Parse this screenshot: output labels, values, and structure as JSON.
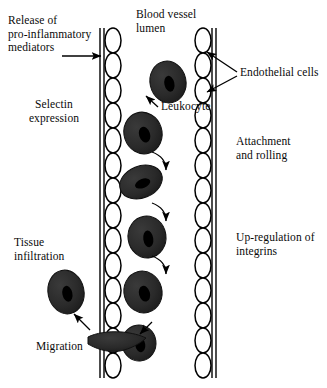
{
  "figure": {
    "background": "#ffffff",
    "ink": "#000000",
    "cell_fill": "#262626"
  },
  "labels": {
    "release": "Release of\npro-inflammatory\nmediators",
    "selectin": "Selectin\nexpression",
    "lumen": "Blood vessel\nlumen",
    "leukocyte": "Leukocyte",
    "endothelial": "Endothelial cells",
    "attachment": "Attachment\nand rolling",
    "upregulation": "Up-regulation of\nintegrins",
    "tissue": "Tissue\ninfiltration",
    "migration": "Migration"
  },
  "vessel": {
    "left_wall": {
      "line_x1": 100,
      "line_x2": 104,
      "ovals_x": 113,
      "oval_rx": 8,
      "oval_ry": 12.5
    },
    "right_wall": {
      "line_x1": 212,
      "line_x2": 216,
      "ovals_x": 203,
      "oval_rx": 8,
      "oval_ry": 12.5
    },
    "top_y": 28,
    "bottom_y": 378,
    "oval_count": 14
  },
  "leukocytes": [
    {
      "name": "free-flowing",
      "cx": 168,
      "cy": 82,
      "rx": 18,
      "ry": 21,
      "rot": -12,
      "nuc_rx": 5,
      "nuc_ry": 8,
      "nuc_rot": -12
    },
    {
      "name": "approaching",
      "cx": 143,
      "cy": 133,
      "rx": 19,
      "ry": 21,
      "rot": -18,
      "nuc_rx": 5.5,
      "nuc_ry": 8,
      "nuc_rot": -22
    },
    {
      "name": "rolling-flattened",
      "cx": 141,
      "cy": 182,
      "rx": 22,
      "ry": 16,
      "rot": -22,
      "nuc_rx": 8,
      "nuc_ry": 4.5,
      "nuc_rot": -22
    },
    {
      "name": "attaching",
      "cx": 147,
      "cy": 237,
      "rx": 19,
      "ry": 21,
      "rot": -8,
      "nuc_rx": 5,
      "nuc_ry": 8.5,
      "nuc_rot": -8
    },
    {
      "name": "arrested",
      "cx": 143,
      "cy": 292,
      "rx": 19,
      "ry": 21,
      "rot": -15,
      "nuc_rx": 5.5,
      "nuc_ry": 8,
      "nuc_rot": -18
    },
    {
      "name": "migrating",
      "cx": 139,
      "cy": 343,
      "rx": 17,
      "ry": 18,
      "rot": -8,
      "nuc_rx": 5,
      "nuc_ry": 7.5,
      "nuc_rot": -8
    },
    {
      "name": "infiltrated-tissue",
      "cx": 66,
      "cy": 292,
      "rx": 18,
      "ry": 22,
      "rot": -12,
      "nuc_rx": 5,
      "nuc_ry": 8,
      "nuc_rot": -12
    }
  ],
  "rolling_arrows": [
    {
      "name": "roll-arrow-1",
      "path": "M152,152 C163,156 166,164 166,170"
    },
    {
      "name": "roll-arrow-2",
      "path": "M152,203 C163,207 166,215 166,221"
    },
    {
      "name": "roll-arrow-3",
      "path": "M152,256 C163,260 166,268 166,274"
    }
  ],
  "straight_arrows": [
    {
      "name": "release-arrow",
      "path": "M62,56 L101,56"
    },
    {
      "name": "leukocyte-pointer",
      "path": "M158,107 L146,96"
    },
    {
      "name": "endothelial-pointer-upper",
      "path": "M237,72 L207,52"
    },
    {
      "name": "endothelial-pointer-lower",
      "path": "M237,76 L207,92"
    },
    {
      "name": "migration-pointer",
      "path": "M152,322 L140,334"
    },
    {
      "name": "tissue-pointer",
      "path": "M90,330 L74,314"
    }
  ],
  "migration_body": {
    "name": "migrating-pseudopod",
    "path": "M88,337 C96,333 108,331 122,332 C132,333 140,335 146,338 C140,344 130,349 120,351 C106,353 95,348 88,344 Z"
  }
}
